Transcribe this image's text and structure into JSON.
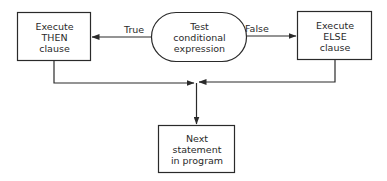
{
  "diagram": {
    "type": "flowchart",
    "nodes": {
      "then_clause": {
        "lines": [
          "Execute",
          "THEN",
          "clause"
        ],
        "shape": "rectangle"
      },
      "test": {
        "lines": [
          "Test",
          "conditional",
          "expression"
        ],
        "shape": "terminal-oval"
      },
      "else_clause": {
        "lines": [
          "Execute",
          "ELSE",
          "clause"
        ],
        "shape": "rectangle"
      },
      "next": {
        "lines": [
          "Next",
          "statement",
          "in program"
        ],
        "shape": "rectangle"
      }
    },
    "edges": [
      {
        "from": "test",
        "to": "then_clause",
        "label": "True"
      },
      {
        "from": "test",
        "to": "else_clause",
        "label": "False"
      },
      {
        "from": "then_clause",
        "to": "next",
        "label": ""
      },
      {
        "from": "else_clause",
        "to": "next",
        "label": ""
      }
    ],
    "labels": {
      "true": "True",
      "false": "False"
    },
    "colors": {
      "stroke": "#2a2a2a",
      "background": "#ffffff"
    }
  }
}
